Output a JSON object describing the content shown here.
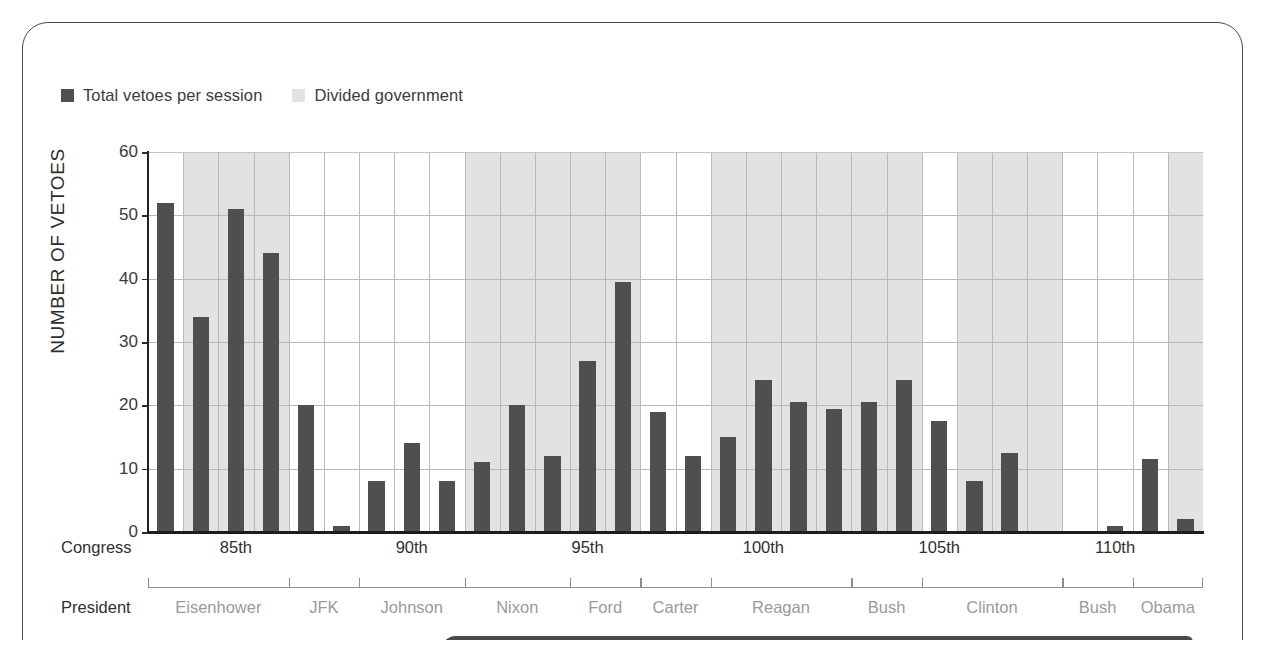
{
  "legend": {
    "items": [
      {
        "label": "Total vetoes per session",
        "swatch_color": "#4f4f4f",
        "icon": "square-swatch-dark"
      },
      {
        "label": "Divided government",
        "swatch_color": "#e2e2e2",
        "icon": "square-swatch-light"
      }
    ]
  },
  "axes": {
    "y_title": "NUMBER OF VETOES",
    "y_ticks": [
      "0",
      "10",
      "20",
      "30",
      "40",
      "50",
      "60"
    ],
    "congress_caption": "Congress",
    "president_caption": "President"
  },
  "chart_data": {
    "type": "bar",
    "title": "",
    "xlabel": "",
    "ylabel": "NUMBER OF VETOES",
    "ylim": [
      0,
      60
    ],
    "ytick_values": [
      0,
      10,
      20,
      30,
      40,
      50,
      60
    ],
    "grid": "horizontal-and-vertical",
    "legend_position": "top-left",
    "bar_color": "#4f4f4f",
    "shaded_band_color": "#e2e2e2",
    "shaded_band_meaning": "Divided government",
    "n_slots": 30,
    "series": [
      {
        "name": "Total vetoes per session",
        "values": [
          52,
          34,
          51,
          44,
          20,
          1,
          8,
          14,
          8,
          11,
          20,
          12,
          27,
          39.5,
          19,
          12,
          15,
          24,
          20.5,
          19.5,
          20.5,
          24,
          17.5,
          8,
          12.5,
          0,
          0,
          1,
          11.5,
          2
        ]
      }
    ],
    "divided_government_by_slot": [
      false,
      true,
      true,
      true,
      false,
      false,
      false,
      false,
      false,
      true,
      true,
      true,
      true,
      true,
      false,
      false,
      true,
      true,
      true,
      true,
      true,
      true,
      false,
      true,
      true,
      true,
      false,
      false,
      false,
      true
    ],
    "congress_labels": [
      "85th",
      "90th",
      "95th",
      "100th",
      "105th",
      "110th"
    ],
    "congress_label_slots": [
      2.5,
      7.5,
      12.5,
      17.5,
      22.5,
      27.5
    ],
    "presidents": [
      {
        "name": "Eisenhower",
        "start_slot": 0,
        "end_slot": 4
      },
      {
        "name": "JFK",
        "start_slot": 4,
        "end_slot": 6
      },
      {
        "name": "Johnson",
        "start_slot": 6,
        "end_slot": 9
      },
      {
        "name": "Nixon",
        "start_slot": 9,
        "end_slot": 12
      },
      {
        "name": "Ford",
        "start_slot": 12,
        "end_slot": 14
      },
      {
        "name": "Carter",
        "start_slot": 14,
        "end_slot": 16
      },
      {
        "name": "Reagan",
        "start_slot": 16,
        "end_slot": 20
      },
      {
        "name": "Bush",
        "start_slot": 20,
        "end_slot": 22
      },
      {
        "name": "Clinton",
        "start_slot": 22,
        "end_slot": 26
      },
      {
        "name": "Bush",
        "start_slot": 26,
        "end_slot": 28
      },
      {
        "name": "Obama",
        "start_slot": 28,
        "end_slot": 30
      }
    ]
  }
}
